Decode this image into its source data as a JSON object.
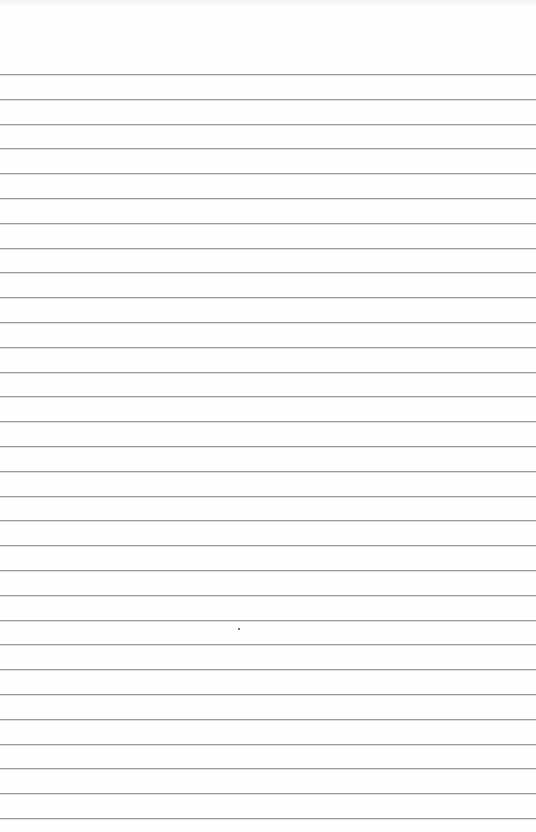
{
  "page": {
    "type": "ruled-notepad-sheet",
    "background_color": "#fefefe",
    "line_color": "#9a9a9a",
    "line_count": 31,
    "first_line_y": 74,
    "line_spacing": 24.8
  },
  "marks": [
    {
      "type": "dot",
      "x": 238,
      "y": 628,
      "color": "#444444"
    }
  ]
}
